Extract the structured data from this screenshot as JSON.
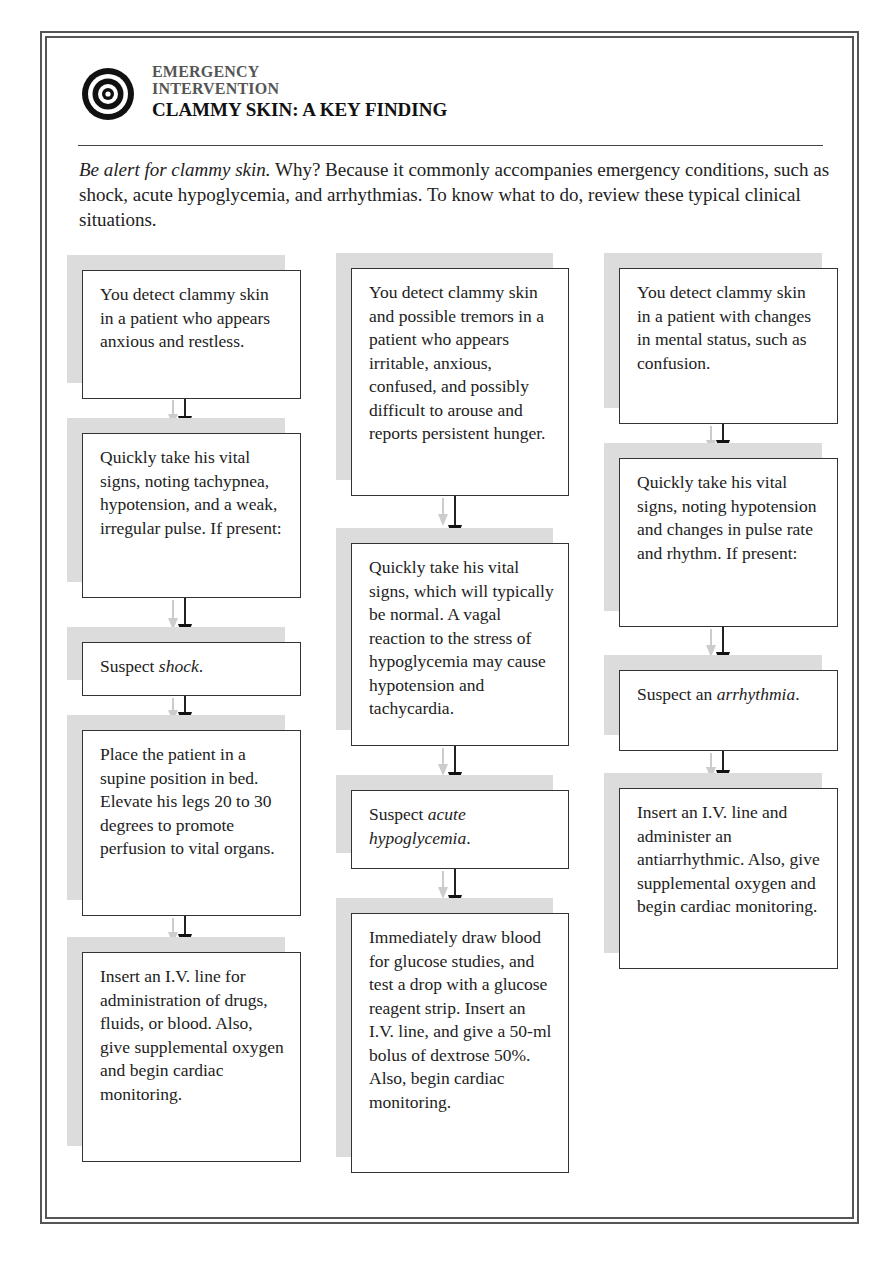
{
  "header": {
    "label_line1": "EMERGENCY",
    "label_line2": "INTERVENTION",
    "title": "CLAMMY SKIN: A KEY FINDING",
    "icon": "target-icon"
  },
  "intro": {
    "lead_italic": "Be alert for clammy skin.",
    "text": " Why? Because it commonly accompanies emergency conditions, such as shock, acute hypoglycemia, and arrhythmias. To know what to do, review these typical clinical situations."
  },
  "colors": {
    "frame": "#555555",
    "shadow": "#dcdcdc",
    "box_border": "#333333",
    "arrow": "#111111",
    "ghost_arrow": "#cccccc"
  },
  "columns": [
    {
      "name": "shock",
      "steps": [
        {
          "text": "You detect clammy skin in a patient who appears anxious and restless."
        },
        {
          "text": "Quickly take his vital signs, noting tachypnea, hypotension, and a weak, irregular pulse. If present:"
        },
        {
          "prefix": "Suspect ",
          "italic": "shock",
          "suffix": "."
        },
        {
          "text": "Place the patient in a supine position in bed. Elevate his legs 20 to 30 degrees to promote perfusion to vital organs."
        },
        {
          "text": "Insert an I.V. line for administration of drugs, fluids, or blood. Also, give supplemental oxygen and begin cardiac monitoring."
        }
      ]
    },
    {
      "name": "hypoglycemia",
      "steps": [
        {
          "text": "You detect clammy skin and possible tremors in a patient who appears irritable, anxious, confused, and possibly difficult to arouse and reports persistent hunger."
        },
        {
          "text": "Quickly take his vital signs, which will typically be normal. A vagal reaction to the stress of hypoglycemia may cause hypotension and tachycardia."
        },
        {
          "prefix": "Suspect ",
          "italic": "acute hypoglycemia",
          "suffix": "."
        },
        {
          "text": "Immediately draw blood for glucose studies, and test a drop with a glucose reagent strip. Insert an I.V. line, and give a 50-ml bolus of dextrose 50%. Also, begin cardiac monitoring."
        }
      ]
    },
    {
      "name": "arrhythmia",
      "steps": [
        {
          "text": "You detect clammy skin in a patient with changes in mental status, such as confusion."
        },
        {
          "text": "Quickly take his vital signs, noting hypotension and changes in pulse rate and rhythm. If present:"
        },
        {
          "prefix": "Suspect an ",
          "italic": "arrhythmia",
          "suffix": "."
        },
        {
          "text": "Insert an I.V. line and administer an antiarrhythmic. Also, give supplemental oxygen and begin cardiac monitoring."
        }
      ]
    }
  ]
}
